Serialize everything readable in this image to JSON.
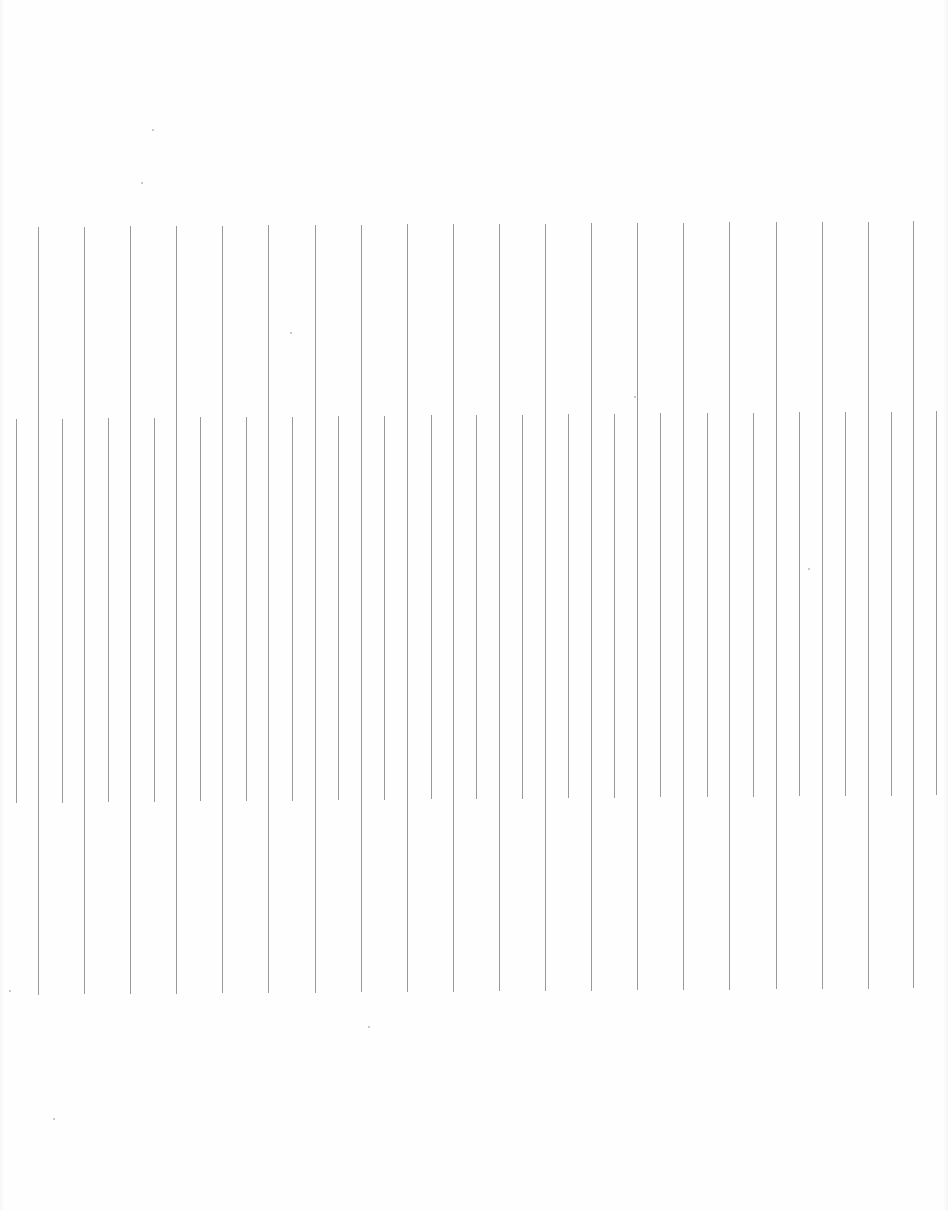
{
  "document": {
    "type": "scanned-ruled-sheet",
    "background_color": "#fefefe",
    "line_color": "#9a9a9a",
    "line_width": 1
  },
  "long_lines": {
    "count": 20,
    "spacing": 46,
    "top_y_left": 227,
    "top_y_right": 221,
    "bottom_y_left": 995,
    "bottom_y_right": 988,
    "x": [
      38,
      84,
      130,
      176,
      222,
      268,
      315,
      361,
      407,
      453,
      499,
      545,
      591,
      637,
      683,
      729,
      776,
      822,
      868,
      913
    ]
  },
  "short_lines": {
    "count": 21,
    "spacing": 46,
    "top_y_left": 419,
    "top_y_right": 411,
    "bottom_y_left": 803,
    "bottom_y_right": 795,
    "x": [
      16,
      62,
      108,
      154,
      200,
      246,
      292,
      338,
      384,
      431,
      476,
      522,
      568,
      614,
      660,
      707,
      753,
      799,
      845,
      891,
      936
    ]
  },
  "specks": [
    {
      "x": 152,
      "y": 129
    },
    {
      "x": 141,
      "y": 182
    },
    {
      "x": 290,
      "y": 332
    },
    {
      "x": 634,
      "y": 396
    },
    {
      "x": 808,
      "y": 568
    },
    {
      "x": 9,
      "y": 990
    },
    {
      "x": 368,
      "y": 1026
    },
    {
      "x": 53,
      "y": 1118
    }
  ]
}
